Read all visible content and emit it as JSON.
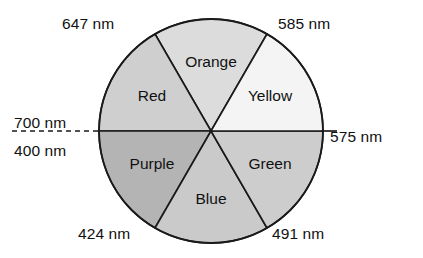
{
  "diagram": {
    "name": "visible-spectrum-color-wheel",
    "geometry": {
      "center_x": 211,
      "center_y": 131,
      "radius": 112
    },
    "wedges": [
      {
        "id": "orange",
        "label": "Orange",
        "fill": "#dcdcdc",
        "start_angle": 60,
        "end_angle": 120,
        "label_x": 211,
        "label_y": 63
      },
      {
        "id": "red",
        "label": "Red",
        "fill": "#cfcfcf",
        "start_angle": 120,
        "end_angle": 180,
        "label_x": 152,
        "label_y": 97
      },
      {
        "id": "purple",
        "label": "Purple",
        "fill": "#b4b4b4",
        "start_angle": 180,
        "end_angle": 240,
        "label_x": 152,
        "label_y": 165
      },
      {
        "id": "blue",
        "label": "Blue",
        "fill": "#cacaca",
        "start_angle": 240,
        "end_angle": 300,
        "label_x": 211,
        "label_y": 200
      },
      {
        "id": "green",
        "label": "Green",
        "fill": "#cdcdcd",
        "start_angle": 300,
        "end_angle": 360,
        "label_x": 270,
        "label_y": 165
      },
      {
        "id": "yellow",
        "label": "Yellow",
        "fill": "#f4f4f4",
        "start_angle": 0,
        "end_angle": 60,
        "label_x": 270,
        "label_y": 97
      }
    ],
    "callouts": [
      {
        "id": "boundary-red-orange",
        "text": "647 nm"
      },
      {
        "id": "boundary-orange-yellow",
        "text": "585 nm"
      },
      {
        "id": "boundary-red-upper",
        "text": "700 nm"
      },
      {
        "id": "boundary-purple-lower",
        "text": "400 nm"
      },
      {
        "id": "boundary-yellow-green",
        "text": "575 nm"
      },
      {
        "id": "boundary-purple-blue",
        "text": "424 nm"
      },
      {
        "id": "boundary-blue-green",
        "text": "491 nm"
      }
    ],
    "colors": {
      "stroke": "#1a1a1a",
      "background": "#ffffff",
      "text": "#111111"
    }
  }
}
